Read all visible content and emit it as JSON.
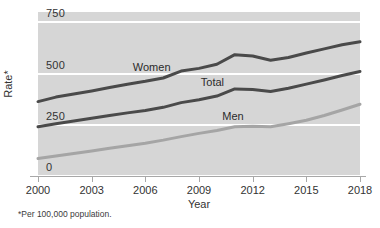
{
  "chart_data": {
    "type": "line",
    "title": "",
    "subtitle": "",
    "xlabel": "Year",
    "ylabel": "Rate*",
    "xlim": [
      2000,
      2018
    ],
    "ylim": [
      0,
      800
    ],
    "grid": true,
    "legend_position": "inline-labels",
    "x": [
      2000,
      2001,
      2002,
      2003,
      2004,
      2005,
      2006,
      2007,
      2008,
      2009,
      2010,
      2011,
      2012,
      2013,
      2014,
      2015,
      2016,
      2017,
      2018
    ],
    "x_tick_labels": [
      "2000",
      "2003",
      "2006",
      "2009",
      "2012",
      "2015",
      "2018"
    ],
    "x_ticks": [
      2000,
      2003,
      2006,
      2009,
      2012,
      2015,
      2018
    ],
    "y_ticks": [
      0,
      250,
      500,
      750
    ],
    "y_tick_labels": [
      "0",
      "250",
      "500",
      "750"
    ],
    "series": [
      {
        "name": "Women",
        "color": "#4a4a4a",
        "values": [
          363,
          385,
          400,
          415,
          432,
          448,
          462,
          478,
          512,
          525,
          545,
          592,
          585,
          565,
          578,
          600,
          620,
          640,
          655
        ]
      },
      {
        "name": "Total",
        "color": "#4a4a4a",
        "values": [
          240,
          255,
          268,
          282,
          295,
          308,
          320,
          335,
          358,
          372,
          390,
          425,
          422,
          412,
          428,
          448,
          468,
          490,
          510
        ]
      },
      {
        "name": "Men",
        "color": "#a5a5a5",
        "values": [
          85,
          98,
          110,
          122,
          135,
          148,
          160,
          175,
          192,
          208,
          222,
          240,
          243,
          240,
          255,
          272,
          295,
          322,
          350
        ]
      }
    ],
    "annotations": [
      {
        "text": "Women",
        "x": 2005.3,
        "y": 525
      },
      {
        "text": "Total",
        "x": 2009.1,
        "y": 452
      },
      {
        "text": "Men",
        "x": 2010.3,
        "y": 290
      }
    ],
    "footnote": "*Per 100,000 population."
  },
  "colors": {
    "plot_background": "#d6d6d6",
    "gridline": "#ffffff",
    "axis": "#a8a8a8",
    "dark_series": "#4a4a4a",
    "light_series": "#a5a5a5",
    "text": "#333333",
    "page_background": "#ffffff"
  }
}
